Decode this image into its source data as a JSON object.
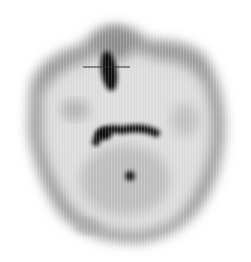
{
  "image": {
    "kind": "grayscale scintigraphy-style scan",
    "width": 251,
    "height": 262,
    "background": "#ffffff",
    "colors": {
      "outline": "#8a8a8a",
      "body_fill": "#c8c8c8",
      "light_fill": "#e6e6e6",
      "hot_spot": "#0c0c0c",
      "marker": "#222222"
    },
    "marker_line": {
      "x1": 83,
      "y1": 67,
      "x2": 130,
      "y2": 67
    },
    "features": [
      {
        "name": "vertical-hot-spot",
        "cx": 109,
        "cy": 71,
        "rx": 9,
        "ry": 21
      },
      {
        "name": "arch-hot-spot",
        "path": "M95,140 Q100,124 125,128 Q145,125 158,130"
      },
      {
        "name": "dot-hot-spot",
        "cx": 130,
        "cy": 176,
        "r": 6
      }
    ]
  }
}
